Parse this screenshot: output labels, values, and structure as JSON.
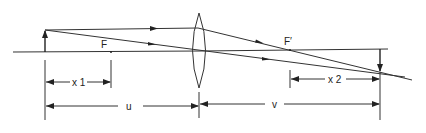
{
  "diagram": {
    "type": "thin-lens-ray-diagram",
    "labels": {
      "front_focus": "F",
      "back_focus": "F′",
      "x1": "x 1",
      "x2": "x 2",
      "u": "u",
      "v": "v"
    },
    "elements": {
      "optical_axis": "optical-axis",
      "lens": "convex-lens",
      "object": "object-arrow-upright",
      "image": "image-arrow-inverted"
    },
    "colors": {
      "line": "#333333",
      "background": "#ffffff"
    }
  }
}
